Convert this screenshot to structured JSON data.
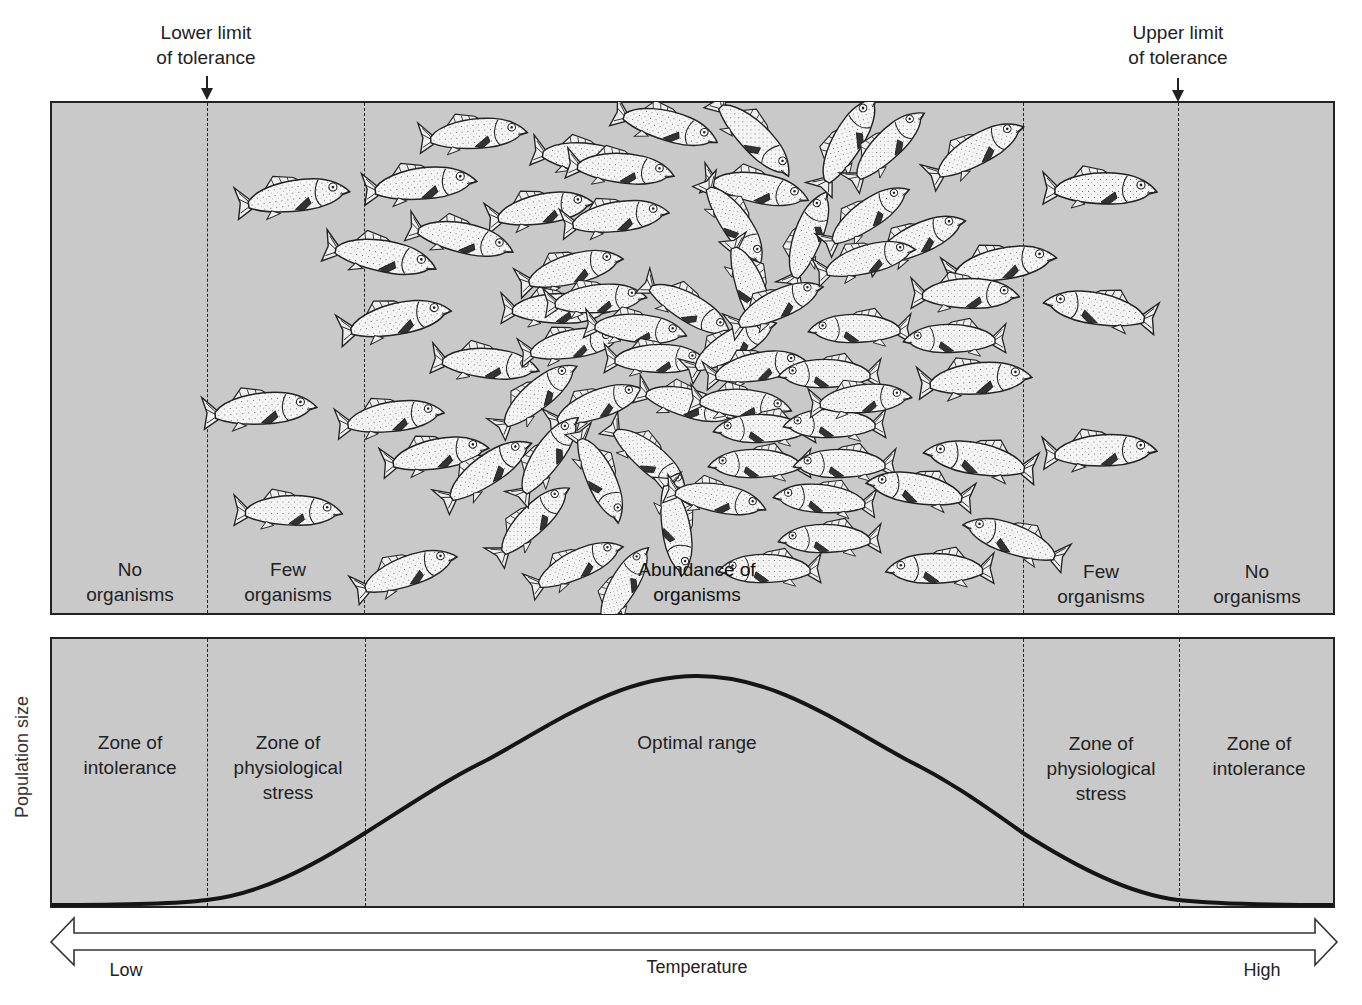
{
  "limits": {
    "lower": {
      "label": "Lower limit\nof tolerance",
      "x": 207
    },
    "upper": {
      "label": "Upper limit\nof tolerance",
      "x": 1178
    }
  },
  "boundaries_x": [
    207,
    365,
    1023,
    1178
  ],
  "colors": {
    "panel_bg": "#c9c9c9",
    "ink": "#222222",
    "fish_body": "#f4f4f4"
  },
  "top_panel": {
    "zones": [
      {
        "label": "No\norganisms",
        "x": 130
      },
      {
        "label": "Few\norganisms",
        "x": 288
      },
      {
        "label": "Abundance of\norganisms",
        "x": 697
      },
      {
        "label": "Few\norganisms",
        "x": 1101
      },
      {
        "label": "No\norganisms",
        "x": 1257
      }
    ]
  },
  "bottom_panel": {
    "y_axis_label": "Population size",
    "zones": [
      {
        "label": "Zone of\nintolerance",
        "x": 130
      },
      {
        "label": "Zone of\nphysiological\nstress",
        "x": 288
      },
      {
        "label": "Optimal range",
        "x": 697
      },
      {
        "label": "Zone of\nphysiological\nstress",
        "x": 1101
      },
      {
        "label": "Zone of\nintolerance",
        "x": 1259
      }
    ]
  },
  "axis": {
    "title": "Temperature",
    "low": "Low",
    "high": "High"
  },
  "chart_data": {
    "type": "line",
    "title": "",
    "xlabel": "Temperature",
    "ylabel": "Population size",
    "x_range_labels": [
      "Low",
      "High"
    ],
    "series": [
      {
        "name": "Population size",
        "shape": "bell curve",
        "x": [
          0,
          0.12,
          0.25,
          0.34,
          0.5,
          0.66,
          0.75,
          0.88,
          1.0
        ],
        "values": [
          0.0,
          0.02,
          0.31,
          0.62,
          1.0,
          0.62,
          0.31,
          0.02,
          0.0
        ]
      }
    ],
    "zones": [
      "Zone of intolerance",
      "Zone of physiological stress",
      "Optimal range",
      "Zone of physiological stress",
      "Zone of intolerance"
    ],
    "annotations": [
      "Lower limit of tolerance",
      "Upper limit of tolerance"
    ],
    "grid": false
  },
  "fish": [
    {
      "x": 298,
      "y": 197,
      "r": -8,
      "f": 1,
      "s": 1.0
    },
    {
      "x": 265,
      "y": 410,
      "r": -5,
      "f": 1,
      "s": 1.0
    },
    {
      "x": 293,
      "y": 512,
      "r": 0,
      "f": 1,
      "s": 0.95
    },
    {
      "x": 425,
      "y": 185,
      "r": -6,
      "f": 1,
      "s": 1.0
    },
    {
      "x": 385,
      "y": 258,
      "r": 10,
      "f": 1,
      "s": 1.0
    },
    {
      "x": 400,
      "y": 320,
      "r": -12,
      "f": 1,
      "s": 1.0
    },
    {
      "x": 395,
      "y": 418,
      "r": -8,
      "f": 1,
      "s": 0.95
    },
    {
      "x": 440,
      "y": 455,
      "r": -10,
      "f": 1,
      "s": 0.95
    },
    {
      "x": 410,
      "y": 572,
      "r": -20,
      "f": 1,
      "s": 0.95
    },
    {
      "x": 478,
      "y": 135,
      "r": -5,
      "f": 1,
      "s": 0.95
    },
    {
      "x": 545,
      "y": 210,
      "r": -10,
      "f": 1,
      "s": 0.95
    },
    {
      "x": 465,
      "y": 240,
      "r": 12,
      "f": 1,
      "s": 0.95
    },
    {
      "x": 490,
      "y": 365,
      "r": 5,
      "f": 1,
      "s": 0.95
    },
    {
      "x": 490,
      "y": 470,
      "r": -35,
      "f": 1,
      "s": 0.95
    },
    {
      "x": 535,
      "y": 520,
      "r": -45,
      "f": 1,
      "s": 0.9
    },
    {
      "x": 580,
      "y": 565,
      "r": -25,
      "f": 1,
      "s": 0.9
    },
    {
      "x": 590,
      "y": 160,
      "r": 8,
      "f": 1,
      "s": 0.95
    },
    {
      "x": 625,
      "y": 170,
      "r": 5,
      "f": 1,
      "s": 0.95
    },
    {
      "x": 620,
      "y": 218,
      "r": -8,
      "f": 1,
      "s": 0.95
    },
    {
      "x": 575,
      "y": 270,
      "r": -15,
      "f": 1,
      "s": 0.95
    },
    {
      "x": 560,
      "y": 310,
      "r": 0,
      "f": 1,
      "s": 0.95
    },
    {
      "x": 600,
      "y": 300,
      "r": -5,
      "f": 1,
      "s": 0.9
    },
    {
      "x": 575,
      "y": 345,
      "r": -10,
      "f": 1,
      "s": 0.9
    },
    {
      "x": 640,
      "y": 330,
      "r": 5,
      "f": 1,
      "s": 0.9
    },
    {
      "x": 660,
      "y": 360,
      "r": 0,
      "f": 1,
      "s": 0.9
    },
    {
      "x": 540,
      "y": 395,
      "r": -40,
      "f": 1,
      "s": 0.9
    },
    {
      "x": 600,
      "y": 405,
      "r": -20,
      "f": 1,
      "s": 0.9
    },
    {
      "x": 550,
      "y": 455,
      "r": -55,
      "f": 1,
      "s": 0.9
    },
    {
      "x": 600,
      "y": 480,
      "r": 65,
      "f": 1,
      "s": 0.9
    },
    {
      "x": 650,
      "y": 460,
      "r": 40,
      "f": 1,
      "s": 0.9
    },
    {
      "x": 675,
      "y": 530,
      "r": 80,
      "f": 1,
      "s": 0.9
    },
    {
      "x": 625,
      "y": 585,
      "r": -60,
      "f": 1,
      "s": 0.85
    },
    {
      "x": 670,
      "y": 128,
      "r": 15,
      "f": 1,
      "s": 0.95
    },
    {
      "x": 755,
      "y": 140,
      "r": 45,
      "f": 1,
      "s": 0.95
    },
    {
      "x": 760,
      "y": 190,
      "r": 10,
      "f": 1,
      "s": 0.95
    },
    {
      "x": 735,
      "y": 225,
      "r": 55,
      "f": 1,
      "s": 0.9
    },
    {
      "x": 750,
      "y": 290,
      "r": 70,
      "f": 1,
      "s": 0.9
    },
    {
      "x": 810,
      "y": 235,
      "r": -70,
      "f": 1,
      "s": 0.9
    },
    {
      "x": 690,
      "y": 310,
      "r": 30,
      "f": 1,
      "s": 0.9
    },
    {
      "x": 735,
      "y": 345,
      "r": -30,
      "f": 1,
      "s": 0.9
    },
    {
      "x": 690,
      "y": 405,
      "r": 15,
      "f": 1,
      "s": 0.9
    },
    {
      "x": 760,
      "y": 368,
      "r": -10,
      "f": 1,
      "s": 0.9
    },
    {
      "x": 745,
      "y": 405,
      "r": 5,
      "f": 1,
      "s": 0.9
    },
    {
      "x": 760,
      "y": 430,
      "r": 0,
      "f": -1,
      "s": 0.9
    },
    {
      "x": 755,
      "y": 465,
      "r": 0,
      "f": -1,
      "s": 0.9
    },
    {
      "x": 720,
      "y": 500,
      "r": 10,
      "f": 1,
      "s": 0.9
    },
    {
      "x": 780,
      "y": 305,
      "r": -25,
      "f": 1,
      "s": 0.9
    },
    {
      "x": 825,
      "y": 375,
      "r": 0,
      "f": -1,
      "s": 0.9
    },
    {
      "x": 830,
      "y": 425,
      "r": 0,
      "f": -1,
      "s": 0.9
    },
    {
      "x": 840,
      "y": 465,
      "r": 0,
      "f": -1,
      "s": 0.9
    },
    {
      "x": 820,
      "y": 500,
      "r": 5,
      "f": -1,
      "s": 0.9
    },
    {
      "x": 825,
      "y": 540,
      "r": 0,
      "f": -1,
      "s": 0.9
    },
    {
      "x": 765,
      "y": 570,
      "r": 0,
      "f": -1,
      "s": 0.9
    },
    {
      "x": 850,
      "y": 140,
      "r": -60,
      "f": 1,
      "s": 0.95
    },
    {
      "x": 890,
      "y": 145,
      "r": -45,
      "f": 1,
      "s": 0.9
    },
    {
      "x": 870,
      "y": 215,
      "r": -35,
      "f": 1,
      "s": 0.9
    },
    {
      "x": 920,
      "y": 240,
      "r": -25,
      "f": 1,
      "s": 0.95
    },
    {
      "x": 870,
      "y": 260,
      "r": -15,
      "f": 1,
      "s": 0.9
    },
    {
      "x": 855,
      "y": 330,
      "r": 0,
      "f": -1,
      "s": 0.9
    },
    {
      "x": 950,
      "y": 340,
      "r": 0,
      "f": -1,
      "s": 0.9
    },
    {
      "x": 865,
      "y": 400,
      "r": -5,
      "f": 1,
      "s": 0.9
    },
    {
      "x": 980,
      "y": 380,
      "r": -5,
      "f": 1,
      "s": 1.0
    },
    {
      "x": 915,
      "y": 490,
      "r": 10,
      "f": -1,
      "s": 0.95
    },
    {
      "x": 975,
      "y": 460,
      "r": 10,
      "f": -1,
      "s": 1.0
    },
    {
      "x": 1010,
      "y": 540,
      "r": 20,
      "f": -1,
      "s": 0.95
    },
    {
      "x": 935,
      "y": 570,
      "r": 0,
      "f": -1,
      "s": 0.95
    },
    {
      "x": 980,
      "y": 150,
      "r": -30,
      "f": 1,
      "s": 0.95
    },
    {
      "x": 1005,
      "y": 265,
      "r": -10,
      "f": 1,
      "s": 1.0
    },
    {
      "x": 970,
      "y": 295,
      "r": 0,
      "f": 1,
      "s": 0.95
    },
    {
      "x": 1105,
      "y": 190,
      "r": 0,
      "f": 1,
      "s": 1.0
    },
    {
      "x": 1095,
      "y": 310,
      "r": 10,
      "f": -1,
      "s": 1.0
    },
    {
      "x": 1105,
      "y": 452,
      "r": -3,
      "f": 1,
      "s": 1.0
    }
  ]
}
